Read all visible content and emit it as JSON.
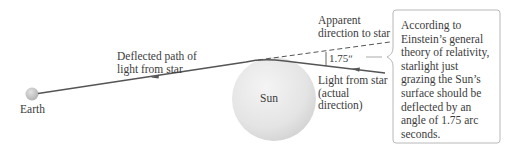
{
  "diagram": {
    "bodies": {
      "earth": {
        "label": "Earth"
      },
      "sun": {
        "label": "Sun"
      }
    },
    "labels": {
      "deflected_path": [
        "Deflected path of",
        "light from star"
      ],
      "apparent_direction": [
        "Apparent",
        "direction to star"
      ],
      "actual_direction": [
        "Light from star",
        "(actual",
        "direction)"
      ],
      "angle": "1.75ʺ"
    },
    "callout": {
      "lines": [
        "According to",
        "Einstein’s general",
        "theory of relativity,",
        "starlight just",
        "grazing the Sun’s",
        "surface should be",
        "deflected by an",
        "angle of 1.75 arc",
        "seconds."
      ]
    },
    "colors": {
      "path_line": "#555555",
      "dashed_line": "#555555",
      "sun_fill": "#e6e6e6",
      "earth_fill": "#cccccc",
      "callout_border": "#bbbbbb",
      "text": "#3c3c3c"
    }
  }
}
